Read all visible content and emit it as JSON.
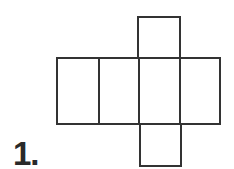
{
  "figure": {
    "label": "1.",
    "stroke_color": "#333333",
    "faces": [
      {
        "name": "row-face-1",
        "x": 57,
        "y": 58,
        "w": 42,
        "h": 66
      },
      {
        "name": "row-face-2",
        "x": 99,
        "y": 58,
        "w": 40,
        "h": 66
      },
      {
        "name": "row-face-3",
        "x": 139,
        "y": 58,
        "w": 41,
        "h": 66
      },
      {
        "name": "row-face-4",
        "x": 180,
        "y": 58,
        "w": 40,
        "h": 66
      },
      {
        "name": "top-face",
        "x": 138,
        "y": 17,
        "w": 42,
        "h": 41
      },
      {
        "name": "bottom-face",
        "x": 140,
        "y": 124,
        "w": 41,
        "h": 42
      }
    ]
  }
}
